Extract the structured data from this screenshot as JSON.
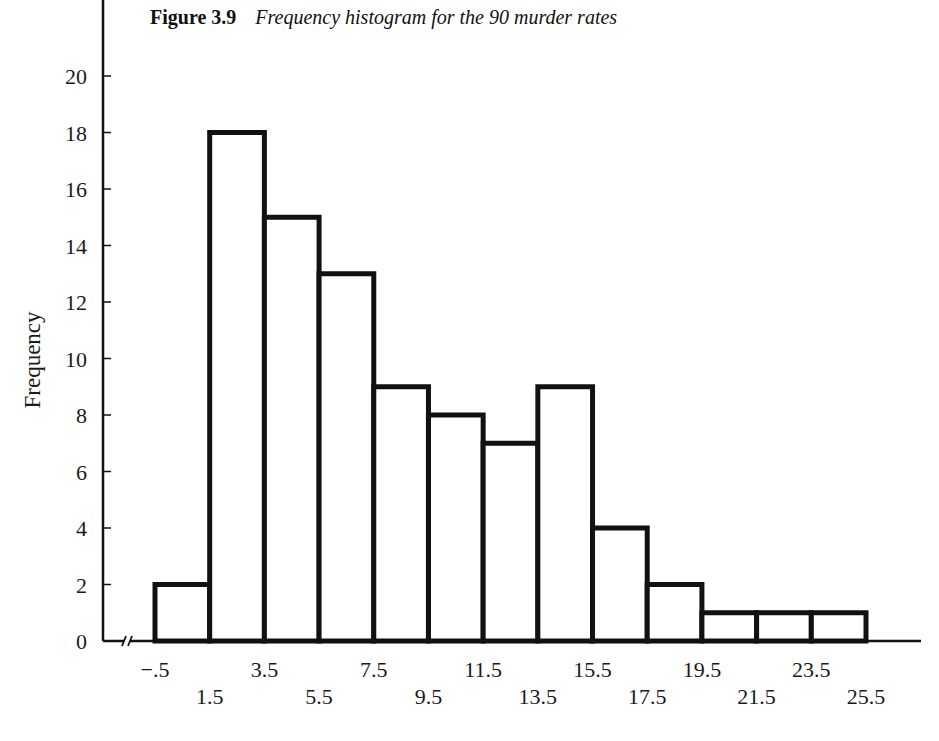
{
  "figure": {
    "number": "Figure 3.9",
    "caption": "Frequency histogram for the 90 murder rates"
  },
  "chart_data": {
    "type": "bar",
    "subtype": "histogram",
    "title": "Figure 3.9 Frequency histogram for the 90 murder rates",
    "xlabel": "",
    "ylabel": "Frequency",
    "bin_edges": [
      -0.5,
      1.5,
      3.5,
      5.5,
      7.5,
      9.5,
      11.5,
      13.5,
      15.5,
      17.5,
      19.5,
      21.5,
      23.5,
      25.5
    ],
    "x_tick_labels_upper": [
      "−.5",
      "3.5",
      "7.5",
      "11.5",
      "15.5",
      "19.5",
      "23.5"
    ],
    "x_tick_labels_lower": [
      "1.5",
      "5.5",
      "9.5",
      "13.5",
      "17.5",
      "21.5",
      "25.5"
    ],
    "categories": [
      "-.5–1.5",
      "1.5–3.5",
      "3.5–5.5",
      "5.5–7.5",
      "7.5–9.5",
      "9.5–11.5",
      "11.5–13.5",
      "13.5–15.5",
      "15.5–17.5",
      "17.5–19.5",
      "19.5–21.5",
      "21.5–23.5",
      "23.5–25.5"
    ],
    "values": [
      2,
      18,
      15,
      13,
      9,
      8,
      7,
      9,
      4,
      2,
      1,
      1,
      1
    ],
    "total": 90,
    "y_ticks": [
      0,
      2,
      4,
      6,
      8,
      10,
      12,
      14,
      16,
      18,
      20
    ],
    "ylim": [
      0,
      21
    ],
    "grid": false,
    "legend": null,
    "axis_break": "x-axis break mark near origin",
    "colors": {
      "bar_fill": "#ffffff",
      "bar_stroke": "#111111",
      "axis": "#111111"
    }
  }
}
